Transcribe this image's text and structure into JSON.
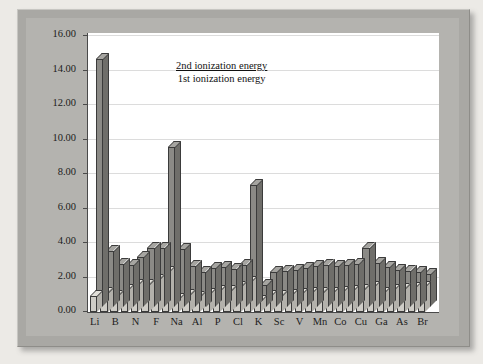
{
  "chart_data": {
    "type": "bar",
    "title": "",
    "xlabel": "",
    "ylabel": "",
    "ylim": [
      0,
      16
    ],
    "ytick_step": 2,
    "ytick_labels": [
      "0.00",
      "2.00",
      "4.00",
      "6.00",
      "8.00",
      "10.00",
      "12.00",
      "14.00",
      "16.00"
    ],
    "grid": true,
    "legend_position": "top-left",
    "style": "3d-clustered-bar",
    "categories": [
      "Li",
      "Be",
      "B",
      "C",
      "N",
      "O",
      "F",
      "Ne",
      "Na",
      "Mg",
      "Al",
      "Si",
      "P",
      "S",
      "Cl",
      "Ar",
      "K",
      "Ca",
      "Sc",
      "Ti",
      "V",
      "Cr",
      "Mn",
      "Fe",
      "Co",
      "Ni",
      "Cu",
      "Zn",
      "Ga",
      "Ge",
      "As",
      "Se",
      "Br"
    ],
    "tick_labels_shown": [
      "Li",
      "B",
      "N",
      "F",
      "Na",
      "Al",
      "P",
      "Cl",
      "K",
      "Sc",
      "V",
      "Mn",
      "Co",
      "Cu",
      "Ga",
      "As",
      "Br"
    ],
    "series": [
      {
        "name": "2nd ionization energy",
        "color": "#8b8a86",
        "values": [
          14.3,
          3.2,
          2.45,
          2.35,
          2.85,
          3.35,
          3.35,
          9.2,
          3.3,
          2.3,
          2.0,
          2.2,
          2.25,
          2.15,
          2.35,
          7.0,
          1.2,
          1.95,
          2.05,
          2.1,
          2.2,
          2.3,
          2.35,
          2.3,
          2.35,
          2.45,
          3.35,
          2.5,
          2.25,
          2.1,
          2.05,
          1.95,
          1.85
        ],
        "units": "arbitrary (×1000 kJ/mol)"
      },
      {
        "name": "1st ionization energy",
        "color": "#cfcdc7",
        "values": [
          0.9,
          1.1,
          0.95,
          1.3,
          1.55,
          1.55,
          1.85,
          2.3,
          0.75,
          1.0,
          0.85,
          1.05,
          1.2,
          1.2,
          1.45,
          1.75,
          0.65,
          0.9,
          0.95,
          1.0,
          1.05,
          1.1,
          1.1,
          1.1,
          1.15,
          1.2,
          1.3,
          1.45,
          1.1,
          1.25,
          1.35,
          1.4,
          1.45
        ],
        "units": "arbitrary (×1000 kJ/mol)"
      }
    ]
  },
  "legend": {
    "second_label": "2nd ionization energy",
    "first_label": "1st ionization energy"
  }
}
